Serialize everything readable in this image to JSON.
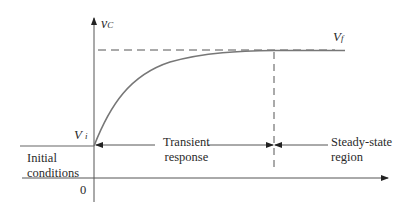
{
  "diagram": {
    "type": "capacitor-voltage-step-response",
    "y_axis_label": "v",
    "y_axis_label_sub": "C",
    "final_value_label": "V",
    "final_value_sub": "f",
    "initial_value_label": "V",
    "initial_value_sub": "i",
    "origin_label": "0",
    "regions": {
      "initial": [
        "Initial",
        "conditions"
      ],
      "transient": [
        "Transient",
        "response"
      ],
      "steady": [
        "Steady-state",
        "region"
      ]
    },
    "colors": {
      "axis": "#555555",
      "curve": "#777777",
      "text": "#2a2a2a"
    }
  }
}
